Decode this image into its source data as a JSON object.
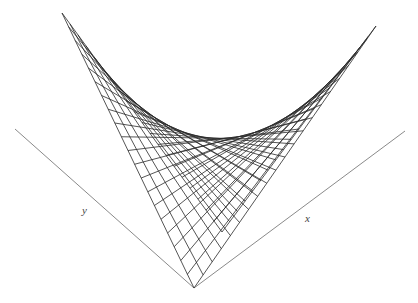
{
  "figure": {
    "axes": {
      "x": {
        "label": "x",
        "from": [
          194,
          288
        ],
        "to": [
          405,
          131
        ],
        "label_pos": [
          305,
          222
        ]
      },
      "y": {
        "label": "y",
        "from": [
          194,
          288
        ],
        "to": [
          15,
          129
        ],
        "label_pos": [
          82,
          214
        ]
      }
    },
    "surface": {
      "type": "bilinear-patch",
      "corners": {
        "origin": [
          194,
          288
        ],
        "x_end": [
          376,
          26
        ],
        "y_end": [
          62,
          13
        ],
        "far": [
          222,
          232
        ]
      },
      "divisions_u": 20,
      "divisions_v": 20,
      "line_color": "#2a2a2a",
      "axis_color": "#8a8a8a"
    }
  }
}
